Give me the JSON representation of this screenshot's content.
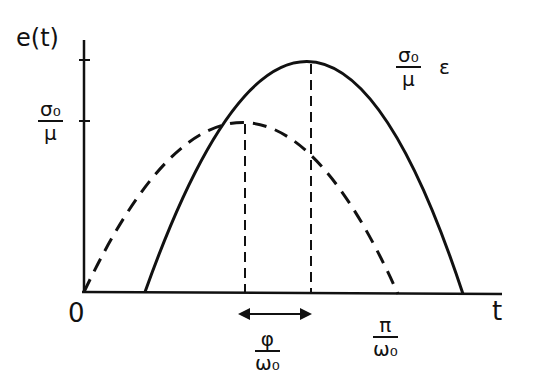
{
  "diagram": {
    "y_axis_label": "e(t)",
    "x_axis_label": "t",
    "origin_label": "0",
    "y_tick_label": {
      "num": "σ₀",
      "den": "μ"
    },
    "curve_label": {
      "num": "σ₀",
      "den": "μ",
      "suffix": "ε"
    },
    "phase_label": {
      "num": "φ",
      "den": "ω₀"
    },
    "half_period_label": {
      "num": "π",
      "den": "ω₀"
    },
    "curves": [
      {
        "name": "stress-dashed",
        "style": "dashed",
        "start_x": 0,
        "end": "π/ω₀",
        "peak": "σ₀/μ"
      },
      {
        "name": "strain-solid",
        "style": "solid",
        "shift": "φ/ω₀",
        "peak": "(σ₀/μ) ε"
      }
    ]
  }
}
